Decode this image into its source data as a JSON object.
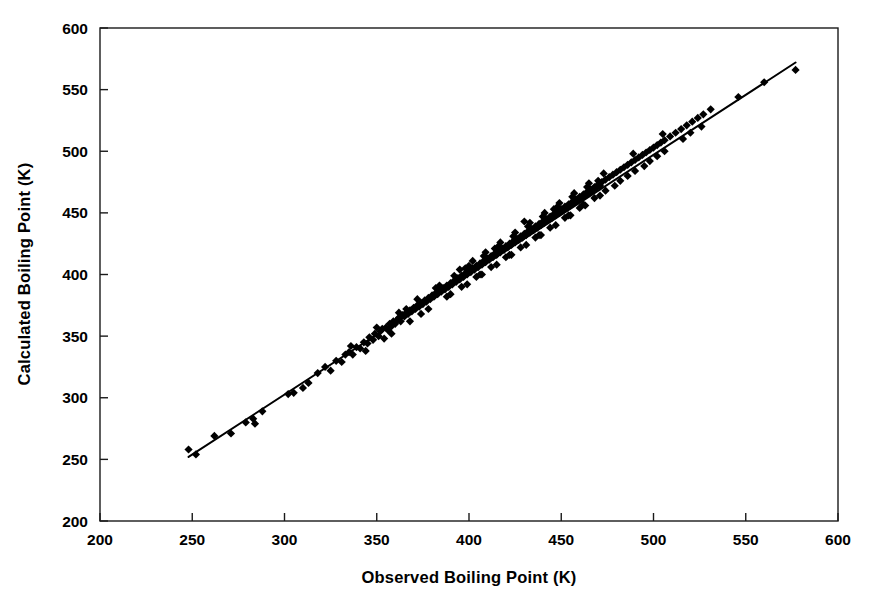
{
  "chart_data": {
    "type": "scatter",
    "title": "",
    "xlabel": "Observed Boiling Point (K)",
    "ylabel": "Calculated Boiling Point (K)",
    "xlim": [
      200,
      600
    ],
    "ylim": [
      200,
      600
    ],
    "xticks": [
      200,
      250,
      300,
      350,
      400,
      450,
      500,
      550,
      600
    ],
    "yticks": [
      200,
      250,
      300,
      350,
      400,
      450,
      500,
      550,
      600
    ],
    "xtick_labels": [
      "200",
      "250",
      "300",
      "350",
      "400",
      "450",
      "500",
      "550",
      "600"
    ],
    "ytick_labels": [
      "200",
      "250",
      "300",
      "350",
      "400",
      "450",
      "500",
      "550",
      "600"
    ],
    "grid": false,
    "legend": null,
    "marker": "diamond",
    "marker_color": "#000000",
    "marker_size": 7,
    "series": [
      {
        "name": "Observed vs Calculated Boiling Point",
        "x": [
          248,
          252,
          262,
          271,
          279,
          283,
          284,
          288,
          302,
          305,
          310,
          313,
          318,
          322,
          325,
          328,
          331,
          333,
          335,
          337,
          339,
          341,
          343,
          345,
          346,
          348,
          349,
          351,
          352,
          353,
          355,
          356,
          357,
          358,
          359,
          360,
          361,
          362,
          363,
          364,
          365,
          366,
          367,
          368,
          369,
          370,
          371,
          372,
          373,
          374,
          375,
          376,
          377,
          378,
          379,
          380,
          381,
          382,
          383,
          384,
          385,
          386,
          387,
          388,
          389,
          390,
          391,
          392,
          393,
          394,
          395,
          396,
          397,
          398,
          399,
          400,
          401,
          402,
          403,
          404,
          405,
          406,
          407,
          408,
          409,
          410,
          411,
          412,
          413,
          414,
          415,
          416,
          417,
          418,
          419,
          420,
          421,
          422,
          423,
          424,
          425,
          426,
          427,
          428,
          429,
          430,
          431,
          432,
          433,
          434,
          435,
          436,
          437,
          438,
          439,
          440,
          441,
          442,
          443,
          444,
          445,
          446,
          447,
          448,
          449,
          450,
          451,
          452,
          453,
          454,
          455,
          456,
          457,
          458,
          459,
          460,
          461,
          462,
          463,
          464,
          465,
          466,
          467,
          468,
          469,
          470,
          471,
          472,
          474,
          476,
          478,
          480,
          482,
          484,
          486,
          488,
          490,
          492,
          494,
          496,
          498,
          500,
          502,
          504,
          506,
          509,
          512,
          515,
          518,
          521,
          524,
          527,
          531,
          546,
          560,
          577,
          336,
          344,
          350,
          354,
          362,
          368,
          372,
          378,
          384,
          388,
          392,
          396,
          400,
          404,
          408,
          412,
          416,
          420,
          424,
          428,
          432,
          436,
          440,
          444,
          448,
          452,
          456,
          460,
          464,
          468,
          474,
          482,
          490,
          498,
          506,
          516,
          526,
          358,
          366,
          374,
          382,
          390,
          398,
          406,
          414,
          422,
          430,
          438,
          446,
          454,
          462,
          470,
          486,
          502,
          520,
          395,
          402,
          409,
          417,
          425,
          433,
          441,
          449,
          457,
          465,
          473,
          489,
          505,
          399,
          407,
          415,
          423,
          431,
          439,
          447,
          455,
          463,
          471,
          479,
          495
        ],
        "y": [
          258,
          254,
          269,
          271,
          280,
          283,
          279,
          289,
          303,
          304,
          308,
          312,
          320,
          325,
          322,
          330,
          329,
          335,
          337,
          335,
          341,
          340,
          345,
          344,
          349,
          347,
          352,
          350,
          354,
          356,
          357,
          355,
          360,
          358,
          362,
          360,
          363,
          365,
          362,
          367,
          366,
          369,
          368,
          371,
          370,
          373,
          372,
          375,
          374,
          377,
          376,
          379,
          378,
          381,
          380,
          383,
          382,
          385,
          384,
          387,
          386,
          389,
          388,
          391,
          390,
          393,
          392,
          395,
          394,
          397,
          396,
          399,
          398,
          401,
          400,
          403,
          402,
          405,
          404,
          407,
          406,
          409,
          408,
          411,
          410,
          413,
          412,
          415,
          414,
          417,
          416,
          419,
          418,
          421,
          420,
          423,
          422,
          425,
          424,
          427,
          426,
          429,
          428,
          431,
          430,
          433,
          432,
          435,
          434,
          437,
          436,
          439,
          438,
          441,
          440,
          443,
          442,
          445,
          444,
          447,
          446,
          449,
          448,
          451,
          450,
          453,
          452,
          455,
          454,
          457,
          456,
          459,
          458,
          461,
          460,
          463,
          462,
          465,
          464,
          467,
          466,
          469,
          468,
          471,
          470,
          473,
          472,
          475,
          477,
          479,
          481,
          483,
          485,
          487,
          489,
          491,
          493,
          495,
          497,
          499,
          501,
          503,
          505,
          507,
          509,
          512,
          515,
          518,
          521,
          524,
          527,
          530,
          534,
          544,
          556,
          566,
          342,
          338,
          357,
          348,
          369,
          362,
          380,
          372,
          391,
          382,
          399,
          390,
          407,
          398,
          415,
          406,
          423,
          414,
          431,
          422,
          439,
          430,
          447,
          438,
          455,
          446,
          463,
          454,
          471,
          462,
          468,
          476,
          484,
          492,
          500,
          510,
          520,
          352,
          372,
          368,
          389,
          384,
          405,
          400,
          421,
          416,
          443,
          432,
          453,
          448,
          457,
          476,
          480,
          496,
          515,
          404,
          411,
          418,
          426,
          434,
          442,
          450,
          458,
          466,
          474,
          482,
          498,
          514,
          392,
          400,
          408,
          416,
          424,
          432,
          440,
          448,
          456,
          464,
          472,
          488
        ],
        "trend_line": {
          "x0": 248,
          "y0": 252,
          "x1": 577,
          "y1": 572
        }
      }
    ]
  }
}
